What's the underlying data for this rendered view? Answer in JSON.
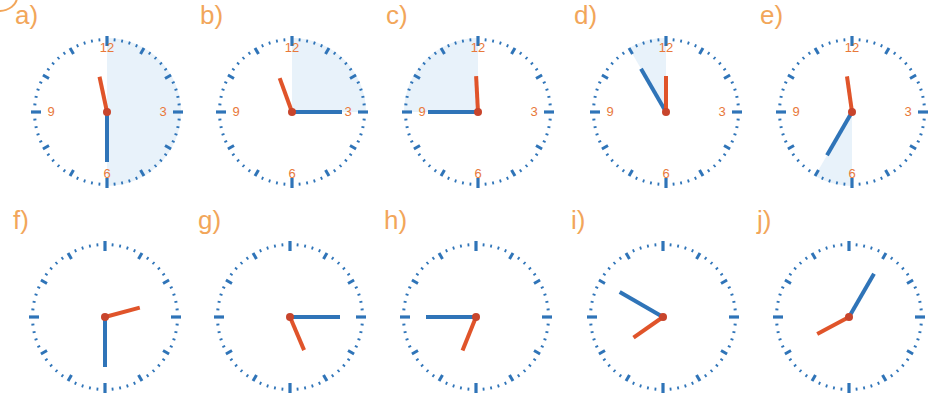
{
  "colors": {
    "tick": "#2f74b8",
    "hour_hand": "#e0542a",
    "minute_hand": "#2f74b8",
    "numeral": "#e8793a",
    "label": "#f2a65a",
    "shade": "#e8f2fa"
  },
  "clocks": [
    {
      "label": "a)",
      "cx": 107,
      "cy": 112,
      "numerals": true,
      "hour_angle": -12,
      "minute_angle": 180,
      "shade": [
        0,
        180
      ],
      "time": "11:30"
    },
    {
      "label": "b)",
      "cx": 292,
      "cy": 112,
      "numerals": true,
      "hour_angle": -20,
      "minute_angle": 90,
      "shade": [
        0,
        90
      ],
      "time": "11:15"
    },
    {
      "label": "c)",
      "cx": 478,
      "cy": 112,
      "numerals": true,
      "hour_angle": -3,
      "minute_angle": 270,
      "shade": [
        270,
        360
      ],
      "time": "11:45"
    },
    {
      "label": "d)",
      "cx": 666,
      "cy": 112,
      "numerals": true,
      "hour_angle": 0,
      "minute_angle": 330,
      "shade": [
        330,
        360
      ],
      "time": "11:55"
    },
    {
      "label": "e)",
      "cx": 852,
      "cy": 112,
      "numerals": true,
      "hour_angle": -8,
      "minute_angle": 210,
      "shade": [
        180,
        210
      ],
      "time": "11:35"
    },
    {
      "label": "f)",
      "cx": 105,
      "cy": 317,
      "numerals": false,
      "hour_angle": 75,
      "minute_angle": 180,
      "shade": null,
      "time": "2:30"
    },
    {
      "label": "g)",
      "cx": 290,
      "cy": 317,
      "numerals": false,
      "hour_angle": 157,
      "minute_angle": 90,
      "shade": null,
      "time": "5:15"
    },
    {
      "label": "h)",
      "cx": 476,
      "cy": 317,
      "numerals": false,
      "hour_angle": 202,
      "minute_angle": 270,
      "shade": null,
      "time": "6:45"
    },
    {
      "label": "i)",
      "cx": 663,
      "cy": 317,
      "numerals": false,
      "hour_angle": 235,
      "minute_angle": 300,
      "shade": null,
      "time": "7:50"
    },
    {
      "label": "j)",
      "cx": 849,
      "cy": 317,
      "numerals": false,
      "hour_angle": 242,
      "minute_angle": 30,
      "shade": null,
      "time": "8:05"
    }
  ],
  "numerals": [
    "12",
    "3",
    "6",
    "9"
  ]
}
